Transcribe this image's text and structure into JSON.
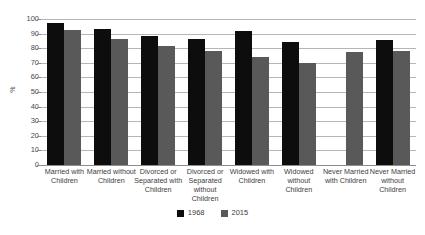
{
  "chart_data": {
    "type": "bar",
    "title": "",
    "subtitle": "",
    "xlabel": "",
    "ylabel": "%",
    "ylim": [
      0,
      100
    ],
    "ytick_step": 10,
    "ytick_labels": [
      "0",
      "10",
      "20",
      "30",
      "40",
      "50",
      "60",
      "70",
      "80",
      "90",
      "100"
    ],
    "grid": true,
    "grid_axis": "y",
    "legend_position": "bottom-center",
    "orientation": "vertical",
    "grouping": "grouped",
    "categories": [
      "Married with Children",
      "Married without Children",
      "Divorced or Separated with Children",
      "Divorced or Separated without Children",
      "Widowed with Children",
      "Widowed without Children",
      "Never Married with Children",
      "Never Married without Children"
    ],
    "series": [
      {
        "name": "1968",
        "color": "#0d0d0d",
        "values": [
          97,
          93.5,
          88.5,
          86,
          92,
          84.5,
          null,
          85.5
        ]
      },
      {
        "name": "2015",
        "color": "#595959",
        "values": [
          92.5,
          86,
          81.5,
          78,
          74,
          70,
          77.5,
          78
        ]
      }
    ]
  },
  "legend": {
    "items": [
      {
        "label": "1968",
        "color": "#0d0d0d"
      },
      {
        "label": "2015",
        "color": "#595959"
      }
    ]
  },
  "axes": {
    "y_title": "%"
  }
}
